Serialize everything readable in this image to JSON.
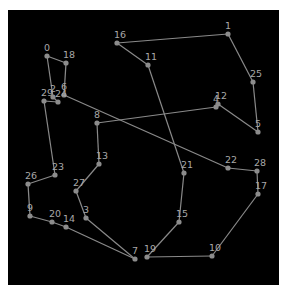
{
  "diagram": {
    "type": "tsp-tour-graph",
    "background": "#000000",
    "frame": {
      "x": 8,
      "y": 10,
      "width": 271,
      "height": 275
    },
    "colors": {
      "edge": "#8a8a8a",
      "node": "#8c8c8c",
      "label": "#a8a8a8",
      "page": "#ffffff"
    },
    "nodes": [
      {
        "id": "0",
        "x": 47,
        "y": 56
      },
      {
        "id": "1",
        "x": 228,
        "y": 34
      },
      {
        "id": "2",
        "x": 53,
        "y": 97
      },
      {
        "id": "3",
        "x": 86,
        "y": 218
      },
      {
        "id": "4",
        "x": 216,
        "y": 107
      },
      {
        "id": "5",
        "x": 258,
        "y": 132
      },
      {
        "id": "6",
        "x": 64,
        "y": 95
      },
      {
        "id": "7",
        "x": 135,
        "y": 259
      },
      {
        "id": "8",
        "x": 97,
        "y": 123
      },
      {
        "id": "9",
        "x": 30,
        "y": 216
      },
      {
        "id": "10",
        "x": 212,
        "y": 256
      },
      {
        "id": "11",
        "x": 148,
        "y": 65
      },
      {
        "id": "12",
        "x": 218,
        "y": 104
      },
      {
        "id": "13",
        "x": 99,
        "y": 164
      },
      {
        "id": "14",
        "x": 66,
        "y": 227
      },
      {
        "id": "15",
        "x": 179,
        "y": 222
      },
      {
        "id": "16",
        "x": 117,
        "y": 43
      },
      {
        "id": "17",
        "x": 258,
        "y": 194
      },
      {
        "id": "18",
        "x": 66,
        "y": 63
      },
      {
        "id": "19",
        "x": 147,
        "y": 257
      },
      {
        "id": "20",
        "x": 52,
        "y": 222
      },
      {
        "id": "21",
        "x": 184,
        "y": 173
      },
      {
        "id": "22",
        "x": 228,
        "y": 168
      },
      {
        "id": "23",
        "x": 55,
        "y": 175
      },
      {
        "id": "24",
        "x": 58,
        "y": 102
      },
      {
        "id": "25",
        "x": 253,
        "y": 82
      },
      {
        "id": "26",
        "x": 28,
        "y": 184
      },
      {
        "id": "27",
        "x": 76,
        "y": 191
      },
      {
        "id": "28",
        "x": 257,
        "y": 171
      },
      {
        "id": "29",
        "x": 44,
        "y": 101
      }
    ],
    "tour": [
      "19",
      "15",
      "21",
      "11",
      "16",
      "1",
      "25",
      "5",
      "12",
      "4",
      "8",
      "13",
      "27",
      "3",
      "7",
      "14",
      "20",
      "9",
      "26",
      "23",
      "29",
      "24",
      "2",
      "0",
      "18",
      "6",
      "22",
      "28",
      "17",
      "10",
      "19"
    ]
  }
}
